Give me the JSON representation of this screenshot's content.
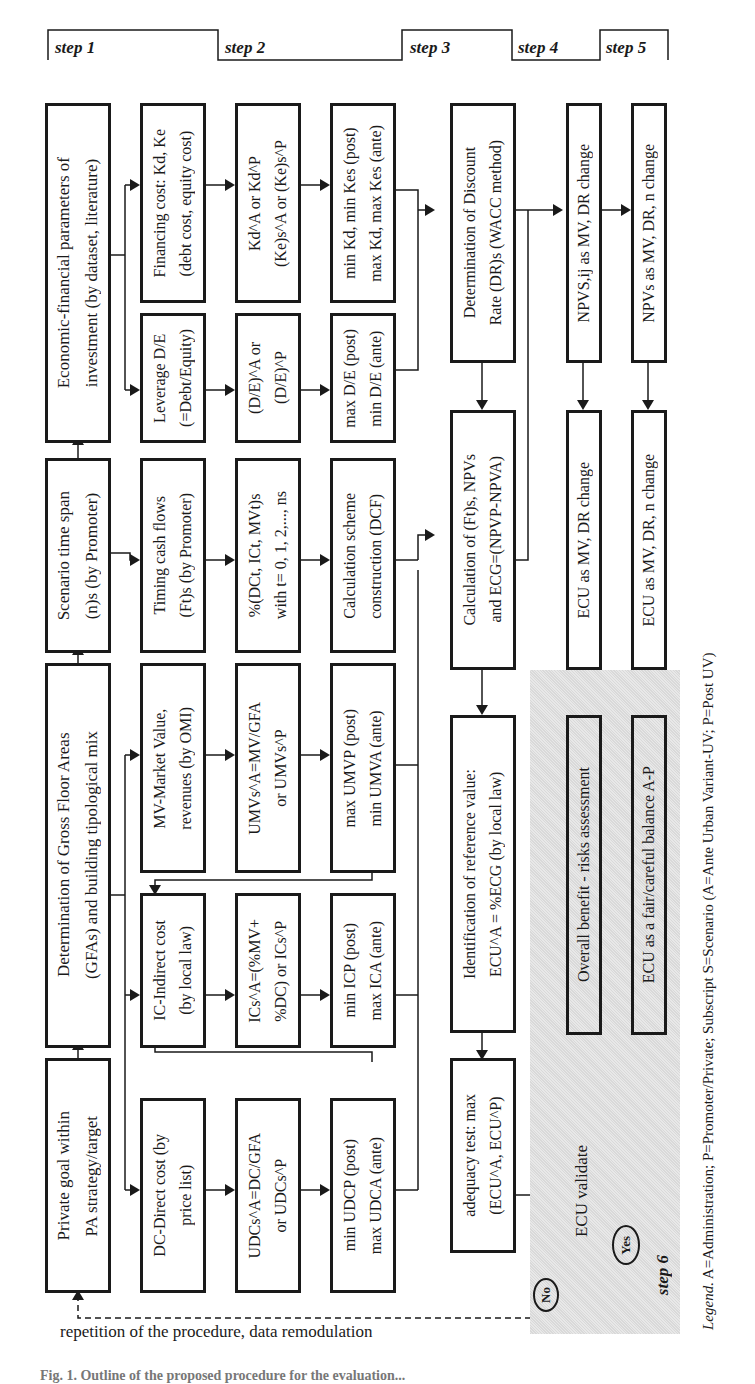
{
  "steps": {
    "step1": "step 1",
    "step2": "step 2",
    "step3": "step 3",
    "step4": "step 4",
    "step5": "step 5",
    "step6": "step 6"
  },
  "step1": {
    "economic": [
      "Economic-financial parameters of",
      "investment (by dataset, literature)"
    ],
    "scenario": [
      "Scenario time span",
      "(n)s (by Promoter)"
    ],
    "gfa": [
      "Determination of Gross Floor Areas",
      "(GFAs) and building tipological mix"
    ],
    "private_goal": [
      "Private goal within",
      "PA strategy/target"
    ]
  },
  "step2": {
    "financing": [
      "Financing cost: Kd, Ke",
      "(debt cost, equity cost)"
    ],
    "leverage": [
      "Leverage D/E",
      "(=Debt/Equity)"
    ],
    "timing": [
      "Timing cash flows",
      "(Ft)s (by Promoter)"
    ],
    "mv": [
      "MV-Market Value,",
      "revenues (by OMI)"
    ],
    "ic": [
      "IC-Indirect cost",
      "(by local law)"
    ],
    "dc": [
      "DC-Direct cost (by",
      "price list)"
    ],
    "kd": [
      "Kd^A or Kd^P",
      "(Ke)s^A or (Ke)s^P"
    ],
    "de": [
      "(D/E)^A or",
      "(D/E)^P"
    ],
    "pct": [
      "%(DCt, ICt, MVt)s",
      "with t= 0, 1, 2,..., ns"
    ],
    "umv": [
      "UMVs^A=MV/GFA",
      "or UMVs^P"
    ],
    "ics": [
      "ICs^A=(%MV+",
      "%DC) or ICs^P"
    ],
    "udc": [
      "UDCs^A=DC/GFA",
      "or UDCs^P"
    ],
    "minmax_k": [
      "min Kd, min Kes (post)",
      "max Kd, max Kes (ante)"
    ],
    "minmax_de": [
      "max D/E (post)",
      "min D/E (ante)"
    ],
    "dcf": [
      "Calculation scheme",
      "construction (DCF)"
    ],
    "minmax_umv": [
      "max UMVP (post)",
      "min UMVA (ante)"
    ],
    "minmax_ic": [
      "min ICP (post)",
      "max ICA (ante)"
    ],
    "minmax_udc": [
      "min UDCP (post)",
      "max UDCA (ante)"
    ]
  },
  "step3": {
    "discount": [
      "Determination of Discount",
      "Rate (DR)s (WACC method)"
    ],
    "calculation": [
      "Calculation of (Ft)s, NPVs",
      "and ECG=(NPVP-NPVA)"
    ],
    "identification": [
      "Identification of reference value:",
      "ECU^A = %ECG (by local law)"
    ],
    "adequacy": [
      "adequacy test: max",
      "(ECU^A, ECU^P)"
    ]
  },
  "step4": {
    "npv": "NPVS,ij as MV, DR change",
    "ecu": "ECU as MV, DR change"
  },
  "step5": {
    "npv": "NPVs as MV, DR, n change",
    "ecu": "ECU as MV, DR, n change"
  },
  "step6": {
    "overall": "Overall benefit - risks assessment",
    "fair": "ECU as a fair/careful balance A-P",
    "decision": "ECU validate",
    "yes": "Yes",
    "no": "No"
  },
  "feedback_note": "repetition of the procedure, data remodulation",
  "legend": {
    "label": "Legend.",
    "text": " A=Administration; P=Promoter/Private; Subscript S=Scenario (A=Ante Urban Variant-UV; P=Post UV)"
  },
  "caption_partial": "Fig. 1. Outline of the proposed procedure for the evaluation..."
}
